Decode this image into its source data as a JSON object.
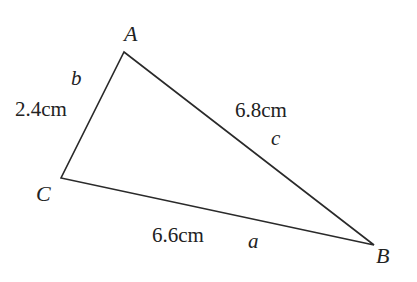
{
  "diagram": {
    "type": "triangle",
    "stroke_color": "#2a2a2a",
    "vertices": {
      "A": {
        "label": "A",
        "x": 124,
        "y": 52
      },
      "B": {
        "label": "B",
        "x": 374,
        "y": 245
      },
      "C": {
        "label": "C",
        "x": 61,
        "y": 178
      }
    },
    "sides": {
      "a": {
        "label": "a",
        "length": "6.6cm",
        "between": "B-C"
      },
      "b": {
        "label": "b",
        "length": "2.4cm",
        "between": "A-C"
      },
      "c": {
        "label": "c",
        "length": "6.8cm",
        "between": "A-B"
      }
    }
  }
}
